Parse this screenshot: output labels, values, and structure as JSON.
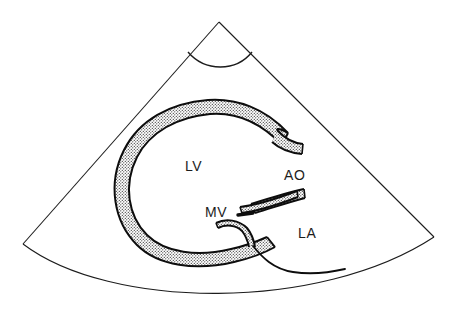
{
  "figure": {
    "modality": "2D echocardiography sector scan",
    "background_color": "#ffffff",
    "line_color": "#1c1c1c",
    "myocardium_fill": "stippled-gray",
    "width": 458,
    "height": 321
  },
  "sector": {
    "name": "ultrasound-sector-fan",
    "apex": {
      "x": 219,
      "y": 22
    },
    "left_corner": {
      "x": 23,
      "y": 244
    },
    "right_corner": {
      "x": 434,
      "y": 237
    },
    "near_field_arc": {
      "left_x": 188,
      "right_x": 252,
      "depth_y": 70
    },
    "far_field_arc_sag_y": 307,
    "stroke_width": 1
  },
  "structures": [
    {
      "id": "lv",
      "name": "left-ventricle",
      "label": "LV",
      "label_x": 185,
      "label_y": 171,
      "description": "Left ventricular cavity bounded by C-shaped stippled myocardium"
    },
    {
      "id": "ao",
      "name": "aorta",
      "label": "AO",
      "label_x": 284,
      "label_y": 180,
      "description": "Aortic root with anterior and posterior walls"
    },
    {
      "id": "mv",
      "name": "mitral-valve",
      "label": "MV",
      "label_x": 205,
      "label_y": 217,
      "description": "Anterior and posterior mitral leaflets"
    },
    {
      "id": "la",
      "name": "left-atrium",
      "label": "LA",
      "label_x": 298,
      "label_y": 238,
      "description": "Left atrial cavity posterior to mitral valve"
    }
  ],
  "myocardium": {
    "name": "lv-myocardial-wall",
    "band_thickness": 13,
    "outer_path": "M 288 133 C 265 108, 236 98, 208 100 C 170 103, 139 120, 124 150 C 107 184, 114 222, 137 245 C 158 266, 196 271, 234 262 C 252 258, 265 252, 274 247",
    "inner_path": "M 283 145 C 262 123, 236 112, 210 114 C 177 117, 150 132, 137 157 C 123 185, 128 216, 147 235 C 165 253, 198 257, 231 249 C 246 246, 258 241, 266 237"
  },
  "aortic_walls": {
    "name": "aortic-root-walls",
    "anterior_outer": "M 276 131 C 284 140, 292 144, 302 145",
    "anterior_inner": "M 272 142 C 281 150, 291 153, 301 154",
    "posterior_outer": "M 252 205 C 268 200, 286 194, 303 190",
    "posterior_inner": "M 255 213 C 272 208, 289 202, 305 198"
  },
  "mitral_leaflets": {
    "anterior": {
      "name": "anterior-mitral-leaflet",
      "path": "M 241 210 C 256 208, 276 202, 296 194",
      "thickness": 5
    },
    "anterior_dash": {
      "name": "anterior-leaflet-dash",
      "x": 238,
      "y": 214,
      "width": 16,
      "height": 3
    },
    "posterior": {
      "name": "posterior-mitral-leaflet",
      "path": "M 217 226 C 226 222, 238 223, 245 230 C 250 235, 252 241, 253 246",
      "thickness": 5
    }
  },
  "la_wall": {
    "name": "left-atrium-posterior-wall",
    "path": "M 253 246 C 261 256, 272 268, 292 272 C 312 276, 332 273, 345 270"
  },
  "texture": {
    "name": "stipple-pattern",
    "dot_color": "#2b2b2b",
    "dot_spacing": 3,
    "dot_radius": 0.62
  }
}
